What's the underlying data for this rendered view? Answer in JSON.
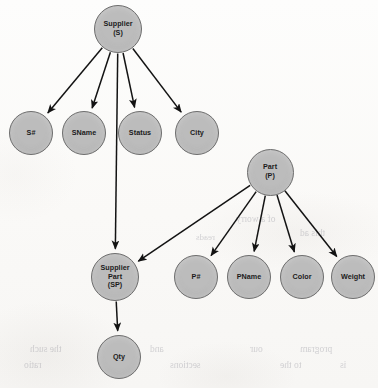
{
  "diagram": {
    "kind": "network-data-model-schema",
    "canvas": {
      "width": 378,
      "height": 388
    },
    "style": {
      "node_fill": "#bcbcbc",
      "node_stroke": "#6e6e6e",
      "edge_color": "#131313",
      "label_color": "#1b1b1b",
      "background": "#fbfbfa"
    },
    "nodes": [
      {
        "id": "supplier",
        "label": "Supplier\n(S)",
        "cx": 118,
        "cy": 29,
        "r": 24,
        "role": "record-type"
      },
      {
        "id": "snum",
        "label": "S#",
        "cx": 31,
        "cy": 133,
        "r": 22,
        "role": "field"
      },
      {
        "id": "sname",
        "label": "SName",
        "cx": 84,
        "cy": 133,
        "r": 22,
        "role": "field"
      },
      {
        "id": "status",
        "label": "Status",
        "cx": 140,
        "cy": 133,
        "r": 22,
        "role": "field"
      },
      {
        "id": "city",
        "label": "City",
        "cx": 197,
        "cy": 133,
        "r": 22,
        "role": "field"
      },
      {
        "id": "part",
        "label": "Part\n(P)",
        "cx": 270,
        "cy": 172,
        "r": 23.5,
        "role": "record-type"
      },
      {
        "id": "supplierpart",
        "label": "Supplier\nPart\n(SP)",
        "cx": 115,
        "cy": 277,
        "r": 24,
        "role": "link-record"
      },
      {
        "id": "pnum",
        "label": "P#",
        "cx": 196,
        "cy": 277,
        "r": 22,
        "role": "field"
      },
      {
        "id": "pname",
        "label": "PName",
        "cx": 249,
        "cy": 277,
        "r": 22,
        "role": "field"
      },
      {
        "id": "color",
        "label": "Color",
        "cx": 302,
        "cy": 277,
        "r": 22,
        "role": "field"
      },
      {
        "id": "weight",
        "label": "Weight",
        "cx": 353,
        "cy": 277,
        "r": 22,
        "role": "field"
      },
      {
        "id": "qty",
        "label": "Qty",
        "cx": 119,
        "cy": 357,
        "r": 22,
        "role": "field"
      }
    ],
    "edges": [
      {
        "from": "supplier",
        "to": "snum"
      },
      {
        "from": "supplier",
        "to": "sname"
      },
      {
        "from": "supplier",
        "to": "status"
      },
      {
        "from": "supplier",
        "to": "city"
      },
      {
        "from": "supplier",
        "to": "supplierpart"
      },
      {
        "from": "part",
        "to": "supplierpart"
      },
      {
        "from": "part",
        "to": "pnum"
      },
      {
        "from": "part",
        "to": "pname"
      },
      {
        "from": "part",
        "to": "color"
      },
      {
        "from": "part",
        "to": "weight"
      },
      {
        "from": "supplierpart",
        "to": "qty"
      }
    ],
    "bleed_through": [
      {
        "text": "of a worry",
        "x": 236,
        "y": 214,
        "size": 9.5
      },
      {
        "text": "this ad",
        "x": 300,
        "y": 228,
        "size": 9.5
      },
      {
        "text": "reads",
        "x": 196,
        "y": 232,
        "size": 9
      },
      {
        "text": "the such",
        "x": 30,
        "y": 344,
        "size": 9.5
      },
      {
        "text": "and",
        "x": 150,
        "y": 344,
        "size": 9.5
      },
      {
        "text": "our",
        "x": 250,
        "y": 344,
        "size": 9.5
      },
      {
        "text": "program",
        "x": 300,
        "y": 344,
        "size": 9.5
      },
      {
        "text": "ratio",
        "x": 24,
        "y": 360,
        "size": 9.5
      },
      {
        "text": "sections",
        "x": 170,
        "y": 360,
        "size": 9.5
      },
      {
        "text": "to the",
        "x": 280,
        "y": 360,
        "size": 9.5
      },
      {
        "text": "is",
        "x": 340,
        "y": 360,
        "size": 9.5
      }
    ]
  }
}
